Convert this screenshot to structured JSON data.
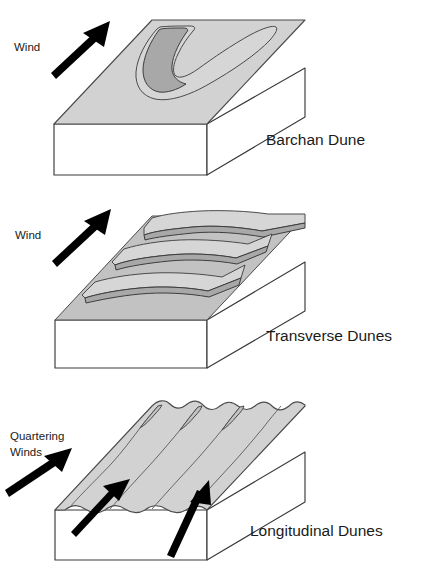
{
  "figure": {
    "background_color": "#ffffff",
    "sand_light_color": "#d6d6d6",
    "sand_dark_color": "#a8a8a8",
    "outline_color": "#3a3a3a",
    "arrow_color": "#000000"
  },
  "panels": [
    {
      "id": "barchan",
      "caption": "Barchan Dune",
      "wind_label": "Wind",
      "wind_direction": "up-right",
      "arrow_count": 1,
      "description": "Single crescent-shaped dune with horns pointing downwind on a rectangular block of ground"
    },
    {
      "id": "transverse",
      "caption": "Transverse Dunes",
      "wind_label": "Wind",
      "wind_direction": "up-right",
      "arrow_count": 1,
      "ridge_count": 3,
      "description": "Parallel wave-like ridges oriented perpendicular to the wind direction"
    },
    {
      "id": "longitudinal",
      "caption": "Longitudinal Dunes",
      "wind_label": "Quartering Winds",
      "wind_label_line1": "Quartering",
      "wind_label_line2": "Winds",
      "wind_direction": "up-right",
      "arrow_count": 3,
      "ridge_count": 4,
      "description": "Long parallel ridges aligned with the prevailing quartering wind direction"
    }
  ]
}
